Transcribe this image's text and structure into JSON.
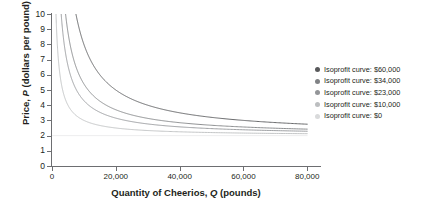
{
  "chart_data": {
    "type": "line",
    "title": "",
    "xlabel": "Quantity of Cheerios, Q (pounds)",
    "ylabel": "Price, P (dollars per pound)",
    "xlabel_parts": {
      "pre": "Quantity of Cheerios, ",
      "italic": "Q",
      "post": " (pounds)"
    },
    "ylabel_parts": {
      "pre": "Price, ",
      "italic": "P",
      "post": " (dollars per pound)"
    },
    "xlim": [
      0,
      84000
    ],
    "ylim": [
      0,
      10
    ],
    "grid": false,
    "legend_position": "right",
    "xticks": [
      0,
      20000,
      40000,
      60000,
      80000
    ],
    "xtick_labels": [
      "0",
      "20,000",
      "40,000",
      "60,000",
      "80,000"
    ],
    "yticks": [
      0,
      1,
      2,
      3,
      4,
      5,
      6,
      7,
      8,
      9,
      10
    ],
    "ytick_labels": [
      "0",
      "1",
      "2",
      "3",
      "4",
      "5",
      "6",
      "7",
      "8",
      "9",
      "10"
    ],
    "marginal_cost": 2,
    "curve_formula": "P = 2 + profit / Q",
    "series": [
      {
        "name": "Isoprofit curve: $60,000",
        "profit": 60000,
        "color": "#58595b",
        "x": [
          7500,
          8500,
          10000,
          12000,
          15000,
          20000,
          25000,
          30000,
          35000,
          40000,
          50000,
          60000,
          70000,
          80000
        ],
        "y": [
          10.0,
          9.06,
          8.0,
          7.0,
          6.0,
          5.0,
          4.4,
          4.0,
          3.71,
          3.5,
          3.2,
          3.0,
          2.86,
          2.75
        ]
      },
      {
        "name": "Isoprofit curve: $34,000",
        "profit": 34000,
        "color": "#808285",
        "x": [
          4250,
          5000,
          6000,
          8000,
          10000,
          12000,
          15000,
          20000,
          25000,
          30000,
          40000,
          50000,
          60000,
          70000,
          80000
        ],
        "y": [
          10.0,
          8.8,
          7.67,
          6.25,
          5.4,
          4.83,
          4.27,
          3.7,
          3.36,
          3.13,
          2.85,
          2.68,
          2.57,
          2.49,
          2.43
        ]
      },
      {
        "name": "Isoprofit curve: $23,000",
        "profit": 23000,
        "color": "#939598",
        "x": [
          2875,
          3500,
          4500,
          6000,
          8000,
          10000,
          12000,
          15000,
          20000,
          25000,
          30000,
          40000,
          50000,
          60000,
          70000,
          80000
        ],
        "y": [
          10.0,
          8.57,
          7.11,
          5.83,
          4.88,
          4.3,
          3.92,
          3.53,
          3.15,
          2.92,
          2.77,
          2.58,
          2.46,
          2.38,
          2.33,
          2.29
        ]
      },
      {
        "name": "Isoprofit curve: $10,000",
        "profit": 10000,
        "color": "#bcbec0",
        "x": [
          1250,
          1600,
          2200,
          3000,
          4000,
          5000,
          6500,
          8000,
          10000,
          13000,
          16000,
          20000,
          25000,
          30000,
          40000,
          50000,
          60000,
          70000,
          80000
        ],
        "y": [
          10.0,
          8.25,
          6.55,
          5.33,
          4.5,
          4.0,
          3.54,
          3.25,
          3.0,
          2.77,
          2.63,
          2.5,
          2.4,
          2.33,
          2.25,
          2.2,
          2.17,
          2.14,
          2.13
        ]
      },
      {
        "name": "Isoprofit curve: $0",
        "profit": 0,
        "color": "#e6e7e8",
        "x": [
          0,
          80000
        ],
        "y": [
          2,
          2
        ]
      }
    ]
  },
  "legend": {
    "items": [
      {
        "label": "Isoprofit curve: $60,000",
        "color": "#58595b"
      },
      {
        "label": "Isoprofit curve: $34,000",
        "color": "#808285"
      },
      {
        "label": "Isoprofit curve: $23,000",
        "color": "#939598"
      },
      {
        "label": "Isoprofit curve: $10,000",
        "color": "#bcbec0"
      },
      {
        "label": "Isoprofit curve: $0",
        "color": "#d9dadb"
      }
    ]
  }
}
